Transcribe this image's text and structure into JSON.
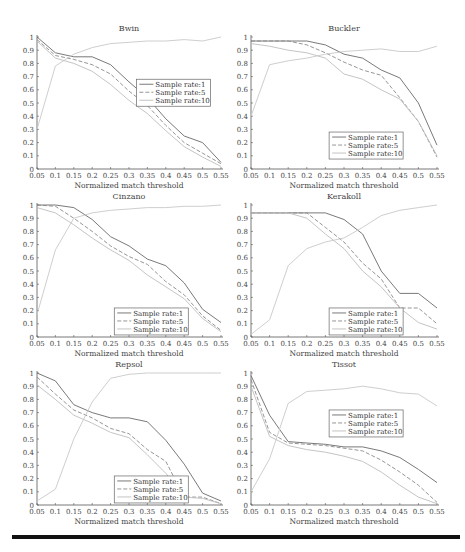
{
  "figure": {
    "xlabel": "Normalized match threshold",
    "x_ticks": [
      "0.05",
      "0.1",
      "0.15",
      "0.2",
      "0.25",
      "0.3",
      "0.35",
      "0.4",
      "0.45",
      "0.5",
      "0.55"
    ],
    "y_ticks": [
      "0",
      "0.1",
      "0.2",
      "0.3",
      "0.4",
      "0.5",
      "0.6",
      "0.7",
      "0.8",
      "0.9",
      "1"
    ],
    "legend_labels": [
      "Sample rate:1",
      "Sample rate:5",
      "Sample rate:10"
    ],
    "series_styles": [
      {
        "color": "#6a6a6a",
        "dash": ""
      },
      {
        "color": "#8a8a8a",
        "dash": "4,2"
      },
      {
        "color": "#bdbdbd",
        "dash": ""
      }
    ],
    "rate10_rising_color": "#c8c8c8"
  },
  "chart_data": [
    {
      "type": "line",
      "title": "Bwin",
      "xlabel": "Normalized match threshold",
      "ylabel": "",
      "x": [
        0.05,
        0.1,
        0.15,
        0.2,
        0.25,
        0.3,
        0.35,
        0.4,
        0.45,
        0.5,
        0.55
      ],
      "ylim": [
        0,
        1
      ],
      "legend_position": "right-middle",
      "legend": {
        "x": 0.54,
        "y": 0.68
      },
      "series": [
        {
          "name": "Sample rate:1",
          "values": [
            1.0,
            0.88,
            0.85,
            0.85,
            0.79,
            0.66,
            0.54,
            0.38,
            0.25,
            0.2,
            0.05
          ]
        },
        {
          "name": "Sample rate:5",
          "values": [
            0.98,
            0.86,
            0.83,
            0.79,
            0.72,
            0.59,
            0.48,
            0.33,
            0.2,
            0.12,
            0.04
          ]
        },
        {
          "name": "Sample rate:10",
          "values": [
            0.97,
            0.84,
            0.8,
            0.74,
            0.64,
            0.52,
            0.42,
            0.29,
            0.17,
            0.09,
            0.02
          ]
        },
        {
          "name": "Sample rate:10 (rising)",
          "values": [
            0.3,
            0.78,
            0.87,
            0.92,
            0.95,
            0.96,
            0.97,
            0.97,
            0.98,
            0.97,
            1.0
          ]
        }
      ]
    },
    {
      "type": "line",
      "title": "Buckler",
      "xlabel": "Normalized match threshold",
      "ylabel": "",
      "x": [
        0.05,
        0.1,
        0.15,
        0.2,
        0.25,
        0.3,
        0.35,
        0.4,
        0.45,
        0.5,
        0.55
      ],
      "ylim": [
        0,
        1
      ],
      "legend_position": "center-lower",
      "legend": {
        "x": 0.42,
        "y": 0.28
      },
      "series": [
        {
          "name": "Sample rate:1",
          "values": [
            0.97,
            0.97,
            0.97,
            0.97,
            0.94,
            0.87,
            0.84,
            0.75,
            0.69,
            0.5,
            0.18
          ]
        },
        {
          "name": "Sample rate:5",
          "values": [
            0.97,
            0.97,
            0.97,
            0.94,
            0.88,
            0.81,
            0.75,
            0.71,
            0.54,
            0.36,
            0.09
          ]
        },
        {
          "name": "Sample rate:10",
          "values": [
            0.95,
            0.93,
            0.9,
            0.88,
            0.84,
            0.72,
            0.68,
            0.6,
            0.53,
            0.36,
            0.1
          ]
        },
        {
          "name": "Sample rate:10 (rising)",
          "values": [
            0.4,
            0.79,
            0.82,
            0.84,
            0.87,
            0.89,
            0.9,
            0.91,
            0.89,
            0.89,
            0.93
          ]
        }
      ]
    },
    {
      "type": "line",
      "title": "Cinzano",
      "xlabel": "Normalized match threshold",
      "ylabel": "",
      "x": [
        0.05,
        0.1,
        0.15,
        0.2,
        0.25,
        0.3,
        0.35,
        0.4,
        0.45,
        0.5,
        0.55
      ],
      "ylim": [
        0,
        1
      ],
      "legend_position": "lower-right",
      "legend": {
        "x": 0.42,
        "y": 0.22
      },
      "series": [
        {
          "name": "Sample rate:1",
          "values": [
            1.0,
            1.0,
            0.98,
            0.89,
            0.76,
            0.69,
            0.59,
            0.54,
            0.41,
            0.21,
            0.11
          ]
        },
        {
          "name": "Sample rate:5",
          "values": [
            1.0,
            0.99,
            0.9,
            0.8,
            0.69,
            0.61,
            0.55,
            0.42,
            0.32,
            0.16,
            0.05
          ]
        },
        {
          "name": "Sample rate:10",
          "values": [
            0.98,
            0.94,
            0.85,
            0.75,
            0.66,
            0.58,
            0.47,
            0.38,
            0.29,
            0.14,
            0.04
          ]
        },
        {
          "name": "Sample rate:10 (rising)",
          "values": [
            0.17,
            0.66,
            0.9,
            0.94,
            0.96,
            0.97,
            0.98,
            0.98,
            0.99,
            0.99,
            1.0
          ]
        }
      ]
    },
    {
      "type": "line",
      "title": "Kerakoll",
      "xlabel": "Normalized match threshold",
      "ylabel": "",
      "x": [
        0.05,
        0.1,
        0.15,
        0.2,
        0.25,
        0.3,
        0.35,
        0.4,
        0.45,
        0.5,
        0.55
      ],
      "ylim": [
        0,
        1
      ],
      "legend_position": "lower-right",
      "legend": {
        "x": 0.42,
        "y": 0.22
      },
      "series": [
        {
          "name": "Sample rate:1",
          "values": [
            0.94,
            0.94,
            0.94,
            0.94,
            0.94,
            0.89,
            0.78,
            0.5,
            0.33,
            0.33,
            0.22
          ]
        },
        {
          "name": "Sample rate:5",
          "values": [
            0.94,
            0.94,
            0.94,
            0.94,
            0.83,
            0.72,
            0.56,
            0.44,
            0.22,
            0.22,
            0.1
          ]
        },
        {
          "name": "Sample rate:10",
          "values": [
            0.94,
            0.94,
            0.94,
            0.9,
            0.78,
            0.67,
            0.5,
            0.38,
            0.22,
            0.11,
            0.06
          ]
        },
        {
          "name": "Sample rate:10 (rising)",
          "values": [
            0.02,
            0.13,
            0.54,
            0.67,
            0.72,
            0.75,
            0.83,
            0.92,
            0.96,
            0.98,
            1.0
          ]
        }
      ]
    },
    {
      "type": "line",
      "title": "Repsol",
      "xlabel": "Normalized match threshold",
      "ylabel": "",
      "x": [
        0.05,
        0.1,
        0.15,
        0.2,
        0.25,
        0.3,
        0.35,
        0.4,
        0.45,
        0.5,
        0.55
      ],
      "ylim": [
        0,
        1
      ],
      "legend_position": "lower-right",
      "legend": {
        "x": 0.42,
        "y": 0.22
      },
      "series": [
        {
          "name": "Sample rate:1",
          "values": [
            1.0,
            0.94,
            0.76,
            0.7,
            0.66,
            0.66,
            0.63,
            0.49,
            0.31,
            0.09,
            0.03
          ]
        },
        {
          "name": "Sample rate:5",
          "values": [
            0.97,
            0.84,
            0.72,
            0.66,
            0.58,
            0.54,
            0.42,
            0.33,
            0.06,
            0.06,
            0.01
          ]
        },
        {
          "name": "Sample rate:10",
          "values": [
            0.91,
            0.8,
            0.68,
            0.62,
            0.55,
            0.51,
            0.38,
            0.24,
            0.06,
            0.05,
            0.01
          ]
        },
        {
          "name": "Sample rate:10 (rising)",
          "values": [
            0.03,
            0.12,
            0.5,
            0.78,
            0.96,
            0.99,
            1.0,
            1.0,
            1.0,
            1.0,
            1.0
          ]
        }
      ]
    },
    {
      "type": "line",
      "title": "Tissot",
      "xlabel": "Normalized match threshold",
      "ylabel": "",
      "x": [
        0.05,
        0.1,
        0.15,
        0.2,
        0.25,
        0.3,
        0.35,
        0.4,
        0.45,
        0.5,
        0.55
      ],
      "ylim": [
        0,
        1
      ],
      "legend_position": "center-upper",
      "legend": {
        "x": 0.42,
        "y": 0.72
      },
      "series": [
        {
          "name": "Sample rate:1",
          "values": [
            0.98,
            0.68,
            0.48,
            0.47,
            0.46,
            0.44,
            0.44,
            0.41,
            0.36,
            0.27,
            0.17
          ]
        },
        {
          "name": "Sample rate:5",
          "values": [
            0.95,
            0.55,
            0.47,
            0.46,
            0.45,
            0.43,
            0.41,
            0.34,
            0.25,
            0.15,
            0.02
          ]
        },
        {
          "name": "Sample rate:10",
          "values": [
            0.9,
            0.52,
            0.45,
            0.42,
            0.4,
            0.37,
            0.33,
            0.25,
            0.15,
            0.06,
            0.01
          ]
        },
        {
          "name": "Sample rate:10 (rising)",
          "values": [
            0.1,
            0.35,
            0.77,
            0.86,
            0.87,
            0.88,
            0.9,
            0.88,
            0.85,
            0.84,
            0.75
          ]
        }
      ]
    }
  ]
}
